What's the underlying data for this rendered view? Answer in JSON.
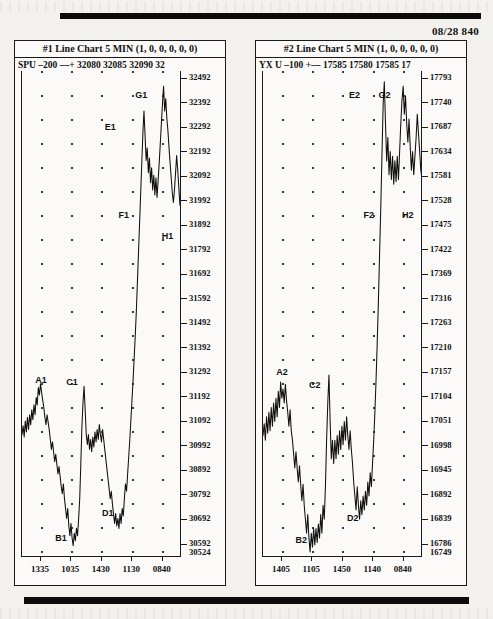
{
  "page": {
    "datestamp": "08/28  840"
  },
  "charts": [
    {
      "id": "chart-1",
      "title": "#1 Line Chart 5 MIN (1, 0, 0, 0, 0, 0)",
      "quote": "SPU –200 ––+  32080 32085 32090 32",
      "symbol": "SPU",
      "y_ticks": [
        "32492",
        "32392",
        "32292",
        "32192",
        "32092",
        "31992",
        "31892",
        "31792",
        "31692",
        "31592",
        "31492",
        "31392",
        "31292",
        "31192",
        "31092",
        "30992",
        "30892",
        "30792",
        "30692",
        "30592"
      ],
      "y_bottom_label": "30524",
      "x_ticks": [
        "1335",
        "1035",
        "1430",
        "1130",
        "0840"
      ],
      "point_labels": [
        {
          "text": "A1",
          "x": 12.0,
          "y": 62.5
        },
        {
          "text": "B1",
          "x": 24.5,
          "y": 95.0
        },
        {
          "text": "C1",
          "x": 31.5,
          "y": 63.0
        },
        {
          "text": "D1",
          "x": 54.0,
          "y": 90.0
        },
        {
          "text": "E1",
          "x": 55.5,
          "y": 10.5
        },
        {
          "text": "F1",
          "x": 64.0,
          "y": 28.5
        },
        {
          "text": "G1",
          "x": 75.0,
          "y": 4.0
        },
        {
          "text": "H1",
          "x": 91.5,
          "y": 33.0
        }
      ],
      "chart_data": {
        "type": "line",
        "title": "#1 Line Chart 5 MIN (1, 0, 0, 0, 0, 0)",
        "xlabel": "",
        "ylabel": "",
        "ylim": [
          30524,
          32492
        ],
        "grid": true,
        "legend": "none",
        "tick_values": [
          32492,
          32392,
          32292,
          32192,
          32092,
          31992,
          31892,
          31792,
          31692,
          31592,
          31492,
          31392,
          31292,
          31192,
          31092,
          30992,
          30892,
          30792,
          30692,
          30592
        ],
        "x_tick_labels": [
          "1335",
          "1035",
          "1430",
          "1130",
          "0840"
        ],
        "annotations": [
          {
            "label": "A1",
            "value": 31225,
            "note": "local high"
          },
          {
            "label": "B1",
            "value": 30570,
            "note": "low"
          },
          {
            "label": "C1",
            "value": 31215,
            "note": "spike high"
          },
          {
            "label": "D1",
            "value": 30640,
            "note": "low"
          },
          {
            "label": "E1",
            "value": 32330,
            "note": "high"
          },
          {
            "label": "F1",
            "value": 32000,
            "note": "pullback"
          },
          {
            "label": "G1",
            "value": 32430,
            "note": "top"
          },
          {
            "label": "H1",
            "value": 31940,
            "note": "drop"
          }
        ],
        "series": [
          {
            "name": "SPU",
            "values": [
              31020,
              31055,
              31010,
              31075,
              31030,
              31090,
              31040,
              31100,
              31060,
              31120,
              31080,
              31140,
              31100,
              31170,
              31140,
              31210,
              31180,
              31225,
              31190,
              31160,
              31130,
              31090,
              31060,
              31100,
              31070,
              31040,
              31000,
              30960,
              30990,
              30950,
              30910,
              30940,
              30900,
              30860,
              30890,
              30850,
              30810,
              30780,
              30820,
              30760,
              30720,
              30680,
              30720,
              30650,
              30610,
              30660,
              30600,
              30570,
              30620,
              30590,
              30640,
              30610,
              30680,
              30760,
              30900,
              31050,
              31150,
              31215,
              31120,
              31020,
              30980,
              31020,
              30960,
              31000,
              30950,
              31010,
              30970,
              31030,
              30990,
              31040,
              31000,
              31060,
              31020,
              30990,
              31040,
              31000,
              30960,
              30920,
              30880,
              30840,
              30800,
              30760,
              30790,
              30740,
              30700,
              30660,
              30700,
              30650,
              30680,
              30640,
              30700,
              30660,
              30720,
              30690,
              30760,
              30820,
              30790,
              30860,
              30930,
              31000,
              31080,
              31160,
              31240,
              31330,
              31420,
              31520,
              31640,
              31760,
              31880,
              32000,
              32120,
              32240,
              32330,
              32230,
              32130,
              32180,
              32080,
              32140,
              32040,
              32100,
              32010,
              32070,
              31990,
              32060,
              31980,
              32050,
              32120,
              32200,
              32280,
              32360,
              32430,
              32330,
              32380,
              32300,
              32250,
              32180,
              32120,
              32060,
              32000,
              31960,
              32010,
              32080,
              32150,
              32090,
              32020,
              31950,
              31940
            ]
          }
        ]
      }
    },
    {
      "id": "chart-2",
      "title": "#2 Line Chart 5 MIN (1, 0, 0, 0, 0, 0)",
      "quote": "YX U –100 +–– 17585 17580 17585 17",
      "symbol": "YX U",
      "y_ticks": [
        "17793",
        "17740",
        "17687",
        "17634",
        "17581",
        "17528",
        "17475",
        "17422",
        "17369",
        "17316",
        "17263",
        "17210",
        "17157",
        "17104",
        "17051",
        "16998",
        "16945",
        "16892",
        "16839",
        "16786"
      ],
      "y_bottom_label": "16749",
      "x_ticks": [
        "1405",
        "1105",
        "1450",
        "1140",
        "0840"
      ],
      "point_labels": [
        {
          "text": "A2",
          "x": 12.0,
          "y": 61.0
        },
        {
          "text": "B2",
          "x": 24.0,
          "y": 95.5
        },
        {
          "text": "C2",
          "x": 32.5,
          "y": 63.5
        },
        {
          "text": "D2",
          "x": 56.5,
          "y": 91.0
        },
        {
          "text": "E2",
          "x": 57.5,
          "y": 4.0
        },
        {
          "text": "F2",
          "x": 66.5,
          "y": 28.5
        },
        {
          "text": "G2",
          "x": 76.5,
          "y": 4.0
        },
        {
          "text": "H2",
          "x": 91.0,
          "y": 28.5
        }
      ],
      "chart_data": {
        "type": "line",
        "title": "#2 Line Chart 5 MIN (1, 0, 0, 0, 0, 0)",
        "xlabel": "",
        "ylabel": "",
        "ylim": [
          16749,
          17793
        ],
        "grid": true,
        "legend": "none",
        "tick_values": [
          17793,
          17740,
          17687,
          17634,
          17581,
          17528,
          17475,
          17422,
          17369,
          17316,
          17263,
          17210,
          17157,
          17104,
          17051,
          16998,
          16945,
          16892,
          16839,
          16786
        ],
        "x_tick_labels": [
          "1405",
          "1105",
          "1450",
          "1140",
          "0840"
        ],
        "annotations": [
          {
            "label": "A2",
            "value": 17125,
            "note": "local high"
          },
          {
            "label": "B2",
            "value": 16775,
            "note": "low"
          },
          {
            "label": "C2",
            "value": 17140,
            "note": "spike high"
          },
          {
            "label": "D2",
            "value": 16830,
            "note": "low"
          },
          {
            "label": "E2",
            "value": 17770,
            "note": "high"
          },
          {
            "label": "F2",
            "value": 17570,
            "note": "pullback"
          },
          {
            "label": "G2",
            "value": 17760,
            "note": "top"
          },
          {
            "label": "H2",
            "value": 17560,
            "note": "drop"
          }
        ],
        "series": [
          {
            "name": "YX U",
            "values": [
              17010,
              17035,
              17000,
              17050,
              17015,
              17060,
              17020,
              17070,
              17030,
              17080,
              17040,
              17090,
              17050,
              17105,
              17070,
              17125,
              17090,
              17110,
              17080,
              17120,
              17085,
              17060,
              17030,
              17065,
              17020,
              17000,
              16970,
              16940,
              16975,
              16940,
              16910,
              16945,
              16905,
              16870,
              16905,
              16860,
              16830,
              16800,
              16840,
              16790,
              16760,
              16800,
              16770,
              16810,
              16775,
              16810,
              16780,
              16820,
              16790,
              16840,
              16800,
              16860,
              16830,
              16900,
              17000,
              17080,
              17140,
              17040,
              16960,
              17000,
              16950,
              17000,
              16960,
              17010,
              16970,
              17020,
              16980,
              17030,
              16990,
              17040,
              17000,
              17050,
              17010,
              16980,
              17020,
              16980,
              16950,
              16910,
              16880,
              16850,
              16900,
              16860,
              16830,
              16870,
              16840,
              16880,
              16850,
              16890,
              16860,
              16910,
              16880,
              16930,
              16900,
              16950,
              17000,
              17060,
              17130,
              17210,
              17300,
              17400,
              17500,
              17610,
              17720,
              17770,
              17680,
              17600,
              17650,
              17570,
              17620,
              17560,
              17610,
              17550,
              17600,
              17555,
              17610,
              17560,
              17620,
              17680,
              17730,
              17760,
              17700,
              17740,
              17680,
              17640,
              17690,
              17630,
              17580,
              17620,
              17570,
              17610,
              17650,
              17700,
              17660,
              17620,
              17580,
              17560
            ]
          }
        ]
      }
    }
  ]
}
